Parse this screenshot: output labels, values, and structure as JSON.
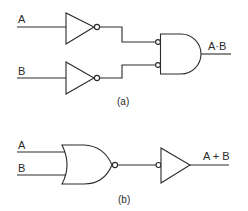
{
  "diagram_a": {
    "caption": "(a)",
    "inputs": [
      {
        "label": "A"
      },
      {
        "label": "B"
      }
    ],
    "gates": [
      {
        "type": "NOT",
        "input": "A"
      },
      {
        "type": "NOT",
        "input": "B"
      },
      {
        "type": "AND",
        "inverted_inputs": true
      }
    ],
    "output": {
      "label": "A·B"
    }
  },
  "diagram_b": {
    "caption": "(b)",
    "inputs": [
      {
        "label": "A"
      },
      {
        "label": "B"
      }
    ],
    "gates": [
      {
        "type": "NOR"
      },
      {
        "type": "NOT",
        "inverted_input": true
      }
    ],
    "output": {
      "label": "A + B"
    }
  },
  "colors": {
    "line": "#2a2a2a",
    "background": "#ffffff"
  }
}
